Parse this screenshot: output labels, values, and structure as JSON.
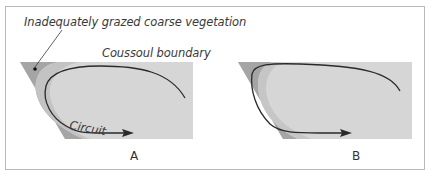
{
  "figure": {
    "annotations": {
      "vegetation": "Inadequately grazed coarse vegetation",
      "boundary": "Coussoul boundary",
      "circuit": "Circuit"
    },
    "panels": [
      {
        "id": "A",
        "label": "A"
      },
      {
        "id": "B",
        "label": "B"
      }
    ],
    "colors": {
      "field": "#d6d6d6",
      "coarse_vegetation": "#a5a5a5",
      "circuit_path": "#2a2a2a",
      "frame": "#b9b9b9"
    }
  }
}
